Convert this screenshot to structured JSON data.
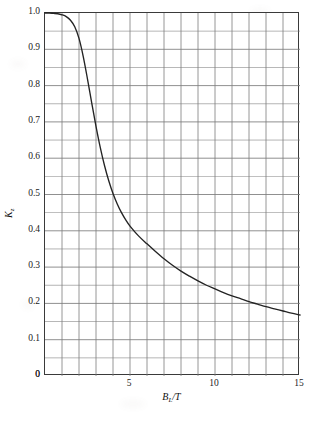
{
  "chart_data": {
    "type": "line",
    "title": "",
    "subtitle": "",
    "xlabel": "B_L/T",
    "xlabel_main": "B",
    "xlabel_sub": "L",
    "xlabel_tail": "/T",
    "ylabel": "K_z",
    "ylabel_main": "K",
    "ylabel_sub": "z",
    "xlim": [
      0,
      15
    ],
    "ylim": [
      0,
      1.0
    ],
    "grid": true,
    "grid_x_step": 1,
    "grid_y_step": 0.05,
    "legend": "none",
    "x_tick_labels": [
      "0",
      "5",
      "10",
      "15"
    ],
    "x_tick_values": [
      0,
      5,
      10,
      15
    ],
    "y_tick_labels": [
      "0",
      "0.1",
      "0.2",
      "0.3",
      "0.4",
      "0.5",
      "0.6",
      "0.7",
      "0.8",
      "0.9",
      "1.0"
    ],
    "y_tick_values": [
      0,
      0.1,
      0.2,
      0.3,
      0.4,
      0.5,
      0.6,
      0.7,
      0.8,
      0.9,
      1.0
    ],
    "series": [
      {
        "name": "Kz",
        "color": "#232323",
        "x": [
          0.0,
          0.25,
          0.5,
          0.75,
          1.0,
          1.25,
          1.5,
          1.75,
          2.0,
          2.25,
          2.5,
          2.75,
          3.0,
          3.25,
          3.5,
          3.75,
          4.0,
          4.25,
          4.5,
          4.75,
          5.0,
          5.5,
          6.0,
          6.5,
          7.0,
          7.5,
          8.0,
          8.5,
          9.0,
          9.5,
          10.0,
          10.5,
          11.0,
          11.5,
          12.0,
          12.5,
          13.0,
          13.5,
          14.0,
          14.5,
          15.0
        ],
        "y": [
          1.0,
          1.0,
          0.999,
          0.998,
          0.995,
          0.99,
          0.98,
          0.962,
          0.93,
          0.88,
          0.818,
          0.752,
          0.688,
          0.63,
          0.58,
          0.538,
          0.503,
          0.474,
          0.45,
          0.43,
          0.413,
          0.386,
          0.364,
          0.343,
          0.323,
          0.305,
          0.289,
          0.275,
          0.262,
          0.25,
          0.24,
          0.23,
          0.221,
          0.213,
          0.205,
          0.198,
          0.191,
          0.185,
          0.179,
          0.173,
          0.168
        ]
      }
    ]
  },
  "axes": {
    "y_ticks": [
      {
        "label": "1.0",
        "value": 1.0
      },
      {
        "label": "0.9",
        "value": 0.9
      },
      {
        "label": "0.8",
        "value": 0.8
      },
      {
        "label": "0.7",
        "value": 0.7
      },
      {
        "label": "0.6",
        "value": 0.6
      },
      {
        "label": "0.5",
        "value": 0.5
      },
      {
        "label": "0.4",
        "value": 0.4
      },
      {
        "label": "0.3",
        "value": 0.3
      },
      {
        "label": "0.2",
        "value": 0.2
      },
      {
        "label": "0.1",
        "value": 0.1
      },
      {
        "label": "0",
        "value": 0
      }
    ],
    "x_ticks": [
      {
        "label": "5",
        "value": 5
      },
      {
        "label": "10",
        "value": 10
      },
      {
        "label": "15",
        "value": 15
      }
    ],
    "x_origin_label": "0"
  },
  "style": {
    "curve_color": "#232323",
    "grid_color": "#7c7c7c",
    "frame_color": "#3a3a3a",
    "background": "#ffffff",
    "text_color": "#1a1a1a"
  }
}
